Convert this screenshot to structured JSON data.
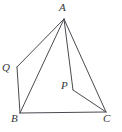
{
  "figure": {
    "background_color": "#ffffff",
    "stroke_color": "#4a4a52",
    "label_color": "#353539",
    "width": 122,
    "height": 132,
    "points": [
      {
        "name": "A",
        "label": "A",
        "x": 64,
        "y": 19,
        "label_x": 59,
        "label_y": 2
      },
      {
        "name": "Q",
        "label": "Q",
        "x": 17,
        "y": 67,
        "label_x": 2,
        "label_y": 62
      },
      {
        "name": "B",
        "label": "B",
        "x": 20,
        "y": 113,
        "label_x": 11,
        "label_y": 113
      },
      {
        "name": "P",
        "label": "P",
        "x": 73,
        "y": 90,
        "label_x": 61,
        "label_y": 80
      },
      {
        "name": "C",
        "label": "C",
        "x": 106,
        "y": 112,
        "label_x": 103,
        "label_y": 113
      }
    ],
    "segments": [
      {
        "name": "A-Q",
        "from": "A",
        "to": "Q"
      },
      {
        "name": "A-B",
        "from": "A",
        "to": "B"
      },
      {
        "name": "A-P",
        "from": "A",
        "to": "P"
      },
      {
        "name": "A-C",
        "from": "A",
        "to": "C"
      },
      {
        "name": "Q-B",
        "from": "Q",
        "to": "B"
      },
      {
        "name": "B-C",
        "from": "B",
        "to": "C"
      },
      {
        "name": "P-C",
        "from": "P",
        "to": "C"
      }
    ]
  }
}
